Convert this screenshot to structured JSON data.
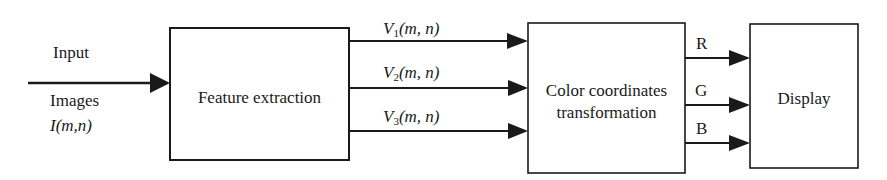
{
  "diagram": {
    "type": "block-diagram",
    "input": {
      "label_top": "Input",
      "label_bottom": "Images",
      "symbol": "I(m,n)"
    },
    "blocks": [
      {
        "id": "feature",
        "label_lines": [
          "Feature extraction"
        ]
      },
      {
        "id": "color",
        "label_lines": [
          "Color coordinates",
          "transformation"
        ]
      },
      {
        "id": "display",
        "label_lines": [
          "Display"
        ]
      }
    ],
    "edges_feature_to_color": [
      {
        "var": "V",
        "sub": "1",
        "args": "(m, n)"
      },
      {
        "var": "V",
        "sub": "2",
        "args": "(m, n)"
      },
      {
        "var": "V",
        "sub": "3",
        "args": "(m, n)"
      }
    ],
    "edges_color_to_display": [
      {
        "label": "R"
      },
      {
        "label": "G"
      },
      {
        "label": "B"
      }
    ],
    "colors": {
      "stroke": "#1a1a1a",
      "background": "#ffffff"
    }
  }
}
